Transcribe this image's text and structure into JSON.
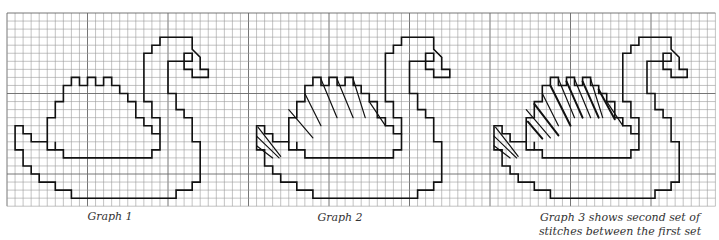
{
  "grid": {
    "origin_x": 7,
    "origin_y": 13,
    "cell": 8.05,
    "cols": 88,
    "rows": 24,
    "line_color": "#9a9a9a",
    "major_color": "#666666",
    "major_every": 10
  },
  "swan": {
    "outer": [
      [
        16,
        2
      ],
      [
        20,
        2
      ],
      [
        20,
        3.5
      ],
      [
        21,
        3.5
      ],
      [
        21,
        4.5
      ],
      [
        20,
        4.5
      ],
      [
        20,
        3.5
      ],
      [
        19,
        3.5
      ],
      [
        19,
        3
      ],
      [
        18,
        3
      ],
      [
        18,
        4
      ],
      [
        19,
        4
      ],
      [
        19,
        3.5
      ]
    ],
    "stroke": "#111111"
  },
  "graphs": [
    {
      "id": "graph1",
      "offset_col": 0,
      "caption": "Graph 1",
      "stitches": "none"
    },
    {
      "id": "graph2",
      "offset_col": 30,
      "caption": "Graph 2",
      "stitches": "first"
    },
    {
      "id": "graph3",
      "offset_col": 59.5,
      "caption": "Graph 3 shows second set of stitches between the first set",
      "caption_lines": [
        "Graph 3 shows second set of",
        "stitches between the first set"
      ],
      "stitches": "both"
    }
  ],
  "header_fragment": "(c)    (d)"
}
